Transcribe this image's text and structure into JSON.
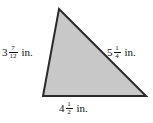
{
  "figure": {
    "name": "triangle-with-side-measurements",
    "background_color": "#ffffff",
    "shape": {
      "type": "triangle",
      "fill_color": "#c8c8c8",
      "stroke_color": "#2a2a2a",
      "stroke_width": 2,
      "vertices": {
        "apex": [
          59,
          9
        ],
        "bottom_left": [
          43,
          96
        ],
        "bottom_right": [
          146,
          96
        ]
      },
      "points": "59,9 146,96 43,96"
    },
    "labels": {
      "left": {
        "whole": "3",
        "numerator": "7",
        "denominator": "12",
        "unit": "in.",
        "text": "3 7/12 in."
      },
      "right": {
        "whole": "5",
        "numerator": "1",
        "denominator": "4",
        "unit": "in.",
        "text": "5 1/4 in."
      },
      "bottom": {
        "whole": "4",
        "numerator": "1",
        "denominator": "2",
        "unit": "in.",
        "text": "4 1/2 in."
      }
    }
  }
}
